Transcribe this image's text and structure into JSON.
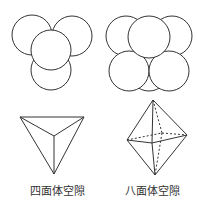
{
  "diagram": {
    "stroke_color": "#333333",
    "panels": [
      {
        "name": "tetrahedral-packing",
        "type": "circle-packing"
      },
      {
        "name": "octahedral-packing",
        "type": "circle-packing"
      },
      {
        "name": "tetrahedron",
        "label": "四面体空隙"
      },
      {
        "name": "octahedron",
        "label": "八面体空隙"
      }
    ]
  },
  "labels": {
    "tetrahedral": "四面体空隙",
    "octahedral": "八面体空隙"
  }
}
